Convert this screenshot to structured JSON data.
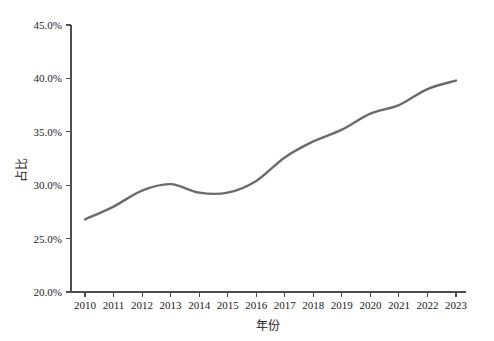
{
  "chart_data": {
    "type": "line",
    "title": "",
    "subtitle": "",
    "xlabel": "年份",
    "ylabel": "占比",
    "categories": [
      "2010",
      "2011",
      "2012",
      "2013",
      "2014",
      "2015",
      "2016",
      "2017",
      "2018",
      "2019",
      "2020",
      "2021",
      "2022",
      "2023"
    ],
    "values": [
      26.8,
      28.0,
      29.5,
      30.1,
      29.3,
      29.3,
      30.4,
      32.6,
      34.1,
      35.2,
      36.7,
      37.5,
      39.0,
      39.8
    ],
    "point_labels": [
      "26.8%",
      "28.0%",
      "29.5%",
      "30.1%",
      "29.3%",
      "29.3%",
      "30.4%",
      "32.6%",
      "34.1%",
      "35.2%",
      "36.7%",
      "37.5%",
      "39.0%",
      "39.8%"
    ],
    "label_positions": [
      "below",
      "below",
      "above",
      "above",
      "below",
      "below",
      "above",
      "above",
      "above",
      "below",
      "above",
      "below",
      "above",
      "below"
    ],
    "ylim": [
      20.0,
      45.0
    ],
    "ytick_values": [
      20.0,
      25.0,
      30.0,
      35.0,
      40.0,
      45.0
    ],
    "ytick_labels": [
      "20.0%",
      "25.0%",
      "30.0%",
      "35.0%",
      "40.0%",
      "45.0%"
    ],
    "xtick_labels": [
      "2010",
      "2011",
      "2012",
      "2013",
      "2014",
      "2015",
      "2016",
      "2017",
      "2018",
      "2019",
      "2020",
      "2021",
      "2022",
      "2023"
    ],
    "grid": false,
    "legend": false,
    "legend_position": "none",
    "series_color": "#6b6b6b",
    "axis_color": "#4d4d4d",
    "text_color": "#1a1a1a",
    "background_color": "#ffffff",
    "smooth": true
  }
}
